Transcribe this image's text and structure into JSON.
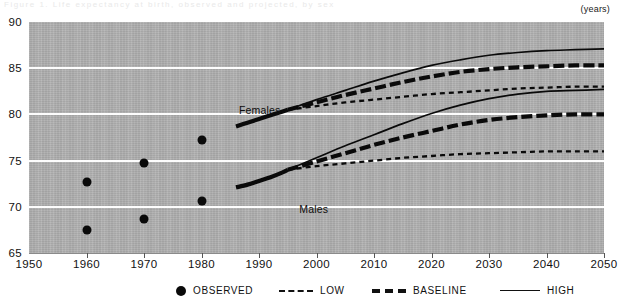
{
  "figure": {
    "ghost_title": "Figure 1. Life expectancy at birth, observed and projected, by sex",
    "unit_label": "(years)"
  },
  "axes": {
    "y_ticks": [
      "90",
      "85",
      "80",
      "75",
      "70",
      "65"
    ],
    "x_ticks": [
      "1950",
      "1960",
      "1970",
      "1980",
      "1990",
      "2000",
      "2010",
      "2020",
      "2030",
      "2040",
      "2050"
    ],
    "gridline_values": [
      85,
      80,
      75,
      70
    ]
  },
  "annotations": {
    "females": "Females",
    "males": "Males"
  },
  "legend": {
    "observed": "OBSERVED",
    "low": "LOW",
    "baseline": "BASELINE",
    "high": "HIGH"
  },
  "colors": {
    "plot_background": "#b0b0b0",
    "gridline": "#fdfdfd",
    "ink": "#0a0a0a",
    "page": "#ffffff"
  },
  "chart_data": {
    "type": "line",
    "title": "Life expectancy at birth, observed and projected, by sex",
    "xlabel": "",
    "ylabel": "(years)",
    "xlim": [
      1950,
      2050
    ],
    "ylim": [
      65,
      90
    ],
    "grid": true,
    "legend_position": "bottom",
    "observed": {
      "type": "scatter",
      "marker": "filled-circle",
      "series": [
        {
          "name": "Females observed",
          "x": [
            1960,
            1970,
            1980
          ],
          "values": [
            72.7,
            74.7,
            77.2
          ]
        },
        {
          "name": "Males observed",
          "x": [
            1960,
            1970,
            1980
          ],
          "values": [
            67.5,
            68.7,
            70.6
          ]
        }
      ]
    },
    "historical": {
      "x": [
        1986,
        1988,
        1990,
        1992,
        1994,
        1995
      ],
      "series": [
        {
          "name": "Females historical",
          "values": [
            78.7,
            79.1,
            79.5,
            79.9,
            80.3,
            80.5
          ]
        },
        {
          "name": "Males historical",
          "values": [
            72.1,
            72.4,
            72.8,
            73.2,
            73.7,
            74.0
          ]
        }
      ]
    },
    "projections": {
      "x": [
        1995,
        2000,
        2005,
        2010,
        2015,
        2020,
        2025,
        2030,
        2035,
        2040,
        2045,
        2050
      ],
      "series": [
        {
          "name": "Females HIGH",
          "sex": "Females",
          "variant": "HIGH",
          "values": [
            80.5,
            81.6,
            82.6,
            83.6,
            84.5,
            85.3,
            85.9,
            86.4,
            86.7,
            86.9,
            87.0,
            87.1
          ]
        },
        {
          "name": "Females BASELINE",
          "sex": "Females",
          "variant": "BASELINE",
          "values": [
            80.5,
            81.3,
            82.1,
            82.8,
            83.5,
            84.1,
            84.6,
            84.9,
            85.1,
            85.2,
            85.3,
            85.3
          ]
        },
        {
          "name": "Females LOW",
          "sex": "Females",
          "variant": "LOW",
          "values": [
            80.5,
            80.9,
            81.3,
            81.6,
            81.9,
            82.2,
            82.4,
            82.6,
            82.8,
            82.9,
            83.0,
            83.0
          ]
        },
        {
          "name": "Males HIGH",
          "sex": "Males",
          "variant": "HIGH",
          "values": [
            74.0,
            75.3,
            76.6,
            77.8,
            79.0,
            80.1,
            81.0,
            81.7,
            82.2,
            82.5,
            82.6,
            82.7
          ]
        },
        {
          "name": "Males BASELINE",
          "sex": "Males",
          "variant": "BASELINE",
          "values": [
            74.0,
            74.9,
            75.8,
            76.7,
            77.5,
            78.2,
            78.9,
            79.4,
            79.7,
            79.9,
            80.0,
            80.0
          ]
        },
        {
          "name": "Males LOW",
          "sex": "Males",
          "variant": "LOW",
          "values": [
            74.0,
            74.4,
            74.7,
            75.0,
            75.3,
            75.5,
            75.7,
            75.8,
            75.9,
            76.0,
            76.0,
            76.0
          ]
        }
      ]
    }
  }
}
